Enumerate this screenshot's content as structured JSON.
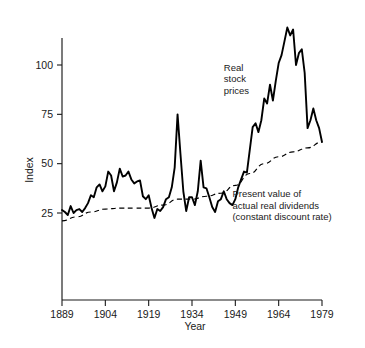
{
  "chart_data": {
    "type": "line",
    "title": "",
    "xlabel": "Year",
    "ylabel": "Index",
    "xlim": [
      1889,
      1979
    ],
    "ylim": [
      0,
      125
    ],
    "grid": false,
    "legend_position": "inline-annotations",
    "xticks": [
      1889,
      1904,
      1919,
      1934,
      1949,
      1964,
      1979
    ],
    "yticks": [
      25,
      50,
      75,
      100
    ],
    "annotations": [
      {
        "name": "real-stock-prices-label",
        "lines": [
          "Real",
          "stock",
          "prices"
        ],
        "x": 1945,
        "y": 97
      },
      {
        "name": "present-value-dividends-label",
        "lines": [
          "Present value of",
          "actual real dividends",
          "(constant discount rate)"
        ],
        "x": 1948,
        "y": 33
      }
    ],
    "series": [
      {
        "name": "Real stock prices",
        "style": "solid",
        "x": [
          1889,
          1890,
          1891,
          1892,
          1893,
          1894,
          1895,
          1896,
          1897,
          1898,
          1899,
          1900,
          1901,
          1902,
          1903,
          1904,
          1905,
          1906,
          1907,
          1908,
          1909,
          1910,
          1911,
          1912,
          1913,
          1914,
          1915,
          1916,
          1917,
          1918,
          1919,
          1920,
          1921,
          1922,
          1923,
          1924,
          1925,
          1926,
          1927,
          1928,
          1929,
          1930,
          1931,
          1932,
          1933,
          1934,
          1935,
          1936,
          1937,
          1938,
          1939,
          1940,
          1941,
          1942,
          1943,
          1944,
          1945,
          1946,
          1947,
          1948,
          1949,
          1950,
          1951,
          1952,
          1953,
          1954,
          1955,
          1956,
          1957,
          1958,
          1959,
          1960,
          1961,
          1962,
          1963,
          1964,
          1965,
          1966,
          1967,
          1968,
          1969,
          1970,
          1971,
          1972,
          1973,
          1974,
          1975,
          1976,
          1977,
          1978,
          1979
        ],
        "values": [
          26.5,
          25.5,
          24.0,
          28.5,
          25.0,
          26.5,
          27.0,
          25.5,
          27.5,
          30.0,
          34.0,
          33.0,
          38.0,
          39.5,
          36.0,
          38.5,
          46.0,
          44.0,
          36.0,
          40.5,
          47.5,
          43.5,
          44.0,
          46.0,
          42.0,
          40.0,
          41.0,
          41.5,
          33.5,
          32.0,
          34.0,
          27.5,
          22.5,
          27.0,
          26.0,
          28.0,
          32.0,
          33.0,
          38.0,
          48.0,
          75.0,
          55.0,
          36.0,
          26.0,
          33.0,
          33.0,
          29.0,
          36.0,
          51.5,
          38.0,
          37.5,
          33.0,
          28.0,
          25.5,
          31.0,
          32.0,
          36.0,
          32.0,
          30.0,
          29.0,
          32.0,
          38.0,
          42.0,
          46.0,
          45.5,
          57.0,
          68.5,
          70.5,
          66.0,
          72.0,
          83.0,
          80.5,
          90.0,
          82.0,
          92.0,
          101.0,
          105.0,
          112.0,
          119.0,
          115.0,
          118.0,
          100.0,
          106.0,
          108.0,
          96.0,
          68.0,
          72.0,
          78.0,
          72.0,
          68.0,
          61.0
        ]
      },
      {
        "name": "Present value of actual real dividends (constant discount rate)",
        "style": "dashed",
        "x": [
          1889,
          1894,
          1899,
          1904,
          1909,
          1914,
          1919,
          1924,
          1929,
          1934,
          1939,
          1944,
          1949,
          1954,
          1959,
          1964,
          1969,
          1974,
          1979
        ],
        "values": [
          21.0,
          23.0,
          25.5,
          27.0,
          27.5,
          27.5,
          27.5,
          29.0,
          32.0,
          32.0,
          33.5,
          35.0,
          39.0,
          45.0,
          50.0,
          53.5,
          56.0,
          58.0,
          61.0
        ]
      }
    ]
  }
}
